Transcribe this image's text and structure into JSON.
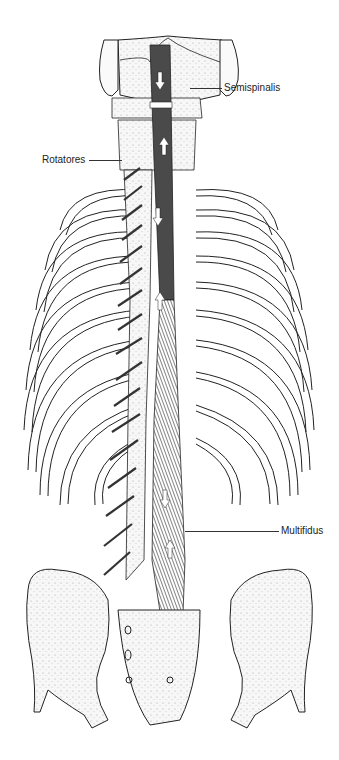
{
  "figure": {
    "colors": {
      "ink": "#222222",
      "muscle": "#4a4a4a",
      "bone_fill": "#f4f4f4",
      "background": "#ffffff"
    },
    "labels": [
      {
        "id": "semispinalis",
        "text": "Semispinalis",
        "x": 224,
        "y": 82,
        "line": {
          "x1": 190,
          "x2": 222,
          "y": 88
        }
      },
      {
        "id": "rotatores",
        "text": "Rotatores",
        "x": 42,
        "y": 154,
        "line": {
          "x1": 89,
          "x2": 122,
          "y": 160
        }
      },
      {
        "id": "multifidus",
        "text": "Multifidus",
        "x": 281,
        "y": 525,
        "line": {
          "x1": 185,
          "x2": 279,
          "y": 531
        }
      }
    ],
    "arrows": [
      {
        "x": 160,
        "y": 80,
        "dir": "down"
      },
      {
        "x": 164,
        "y": 145,
        "dir": "up"
      },
      {
        "x": 158,
        "y": 215,
        "dir": "down"
      },
      {
        "x": 160,
        "y": 300,
        "dir": "up"
      },
      {
        "x": 165,
        "y": 497,
        "dir": "down"
      },
      {
        "x": 170,
        "y": 550,
        "dir": "up"
      }
    ]
  }
}
